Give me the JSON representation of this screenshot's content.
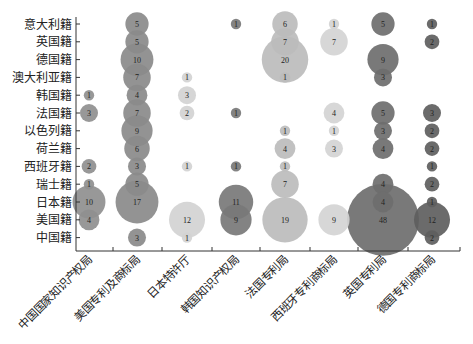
{
  "chart_data": {
    "type": "bubble",
    "title": "",
    "xlabel": "",
    "ylabel": "",
    "grid": false,
    "legend": null,
    "categories_x": [
      "中国国家知识产权局",
      "美国专利及商标局",
      "日本特许厅",
      "韩国知识产权局",
      "法国专利局",
      "西班牙专利商标局",
      "英国专利局",
      "德国专利商标局"
    ],
    "categories_y": [
      "意大利籍",
      "英国籍",
      "德国籍",
      "澳大利亚籍",
      "韩国籍",
      "法国籍",
      "以色列籍",
      "荷兰籍",
      "西班牙籍",
      "瑞士籍",
      "日本籍",
      "美国籍",
      "中国籍"
    ],
    "series": [
      {
        "name": "中国国家知识产权局",
        "color": "#8f8f8f",
        "values": {
          "韩国籍": 1,
          "法国籍": 3,
          "西班牙籍": 2,
          "瑞士籍": 1,
          "日本籍": 10,
          "美国籍": 4
        }
      },
      {
        "name": "美国专利及商标局",
        "color": "#8a8a8a",
        "values": {
          "意大利籍": 5,
          "英国籍": 5,
          "德国籍": 10,
          "澳大利亚籍": 7,
          "韩国籍": 4,
          "法国籍": 7,
          "以色列籍": 9,
          "荷兰籍": 6,
          "西班牙籍": 3,
          "瑞士籍": 5,
          "日本籍": 17,
          "中国籍": 3
        }
      },
      {
        "name": "日本特许厅",
        "color": "#d2d2d2",
        "values": {
          "澳大利亚籍": 1,
          "韩国籍": 3,
          "法国籍": 2,
          "西班牙籍": 1,
          "美国籍": 12,
          "中国籍": 1
        }
      },
      {
        "name": "韩国知识产权局",
        "color": "#787878",
        "values": {
          "意大利籍": 1,
          "法国籍": 1,
          "西班牙籍": 1,
          "日本籍": 11,
          "美国籍": 9
        }
      },
      {
        "name": "法国专利局",
        "color": "#bcbcbc",
        "values": {
          "意大利籍": 6,
          "英国籍": 7,
          "德国籍": 20,
          "澳大利亚籍": 1,
          "以色列籍": 1,
          "荷兰籍": 4,
          "西班牙籍": 1,
          "瑞士籍": 7,
          "美国籍": 19
        }
      },
      {
        "name": "西班牙专利商标局",
        "color": "#d4d4d4",
        "values": {
          "意大利籍": 1,
          "英国籍": 7,
          "法国籍": 4,
          "以色列籍": 1,
          "荷兰籍": 3,
          "美国籍": 9
        }
      },
      {
        "name": "英国专利局",
        "color": "#6e6e6e",
        "values": {
          "意大利籍": 5,
          "德国籍": 9,
          "澳大利亚籍": 3,
          "法国籍": 5,
          "以色列籍": 3,
          "荷兰籍": 4,
          "瑞士籍": 4,
          "日本籍": 4,
          "美国籍": 48
        }
      },
      {
        "name": "德国专利商标局",
        "color": "#5e5e5e",
        "values": {
          "意大利籍": 1,
          "英国籍": 2,
          "法国籍": 3,
          "以色列籍": 2,
          "荷兰籍": 2,
          "西班牙籍": 1,
          "瑞士籍": 2,
          "日本籍": 1,
          "美国籍": 12,
          "中国籍": 2
        }
      }
    ]
  }
}
